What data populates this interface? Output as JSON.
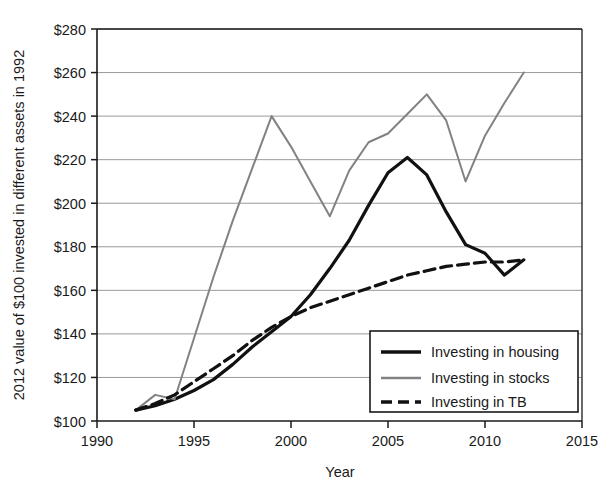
{
  "chart_data": {
    "type": "line",
    "title": "",
    "xlabel": "Year",
    "ylabel": "2012 value of $100 invested in different assets in 1992",
    "xlim": [
      1990,
      2015
    ],
    "ylim": [
      100,
      280
    ],
    "xticks": [
      1990,
      1995,
      2000,
      2005,
      2010,
      2015
    ],
    "xtick_labels": [
      "1990",
      "1995",
      "2000",
      "2005",
      "2010",
      "2015"
    ],
    "yticks": [
      100,
      120,
      140,
      160,
      180,
      200,
      220,
      240,
      260,
      280
    ],
    "ytick_labels": [
      "$100",
      "$120",
      "$140",
      "$160",
      "$180",
      "$200",
      "$220",
      "$240",
      "$260",
      "$280"
    ],
    "grid": true,
    "grid_axis": "y",
    "legend_position": "lower right",
    "x": [
      1992,
      1993,
      1994,
      1995,
      1996,
      1997,
      1998,
      1999,
      2000,
      2001,
      2002,
      2003,
      2004,
      2005,
      2006,
      2007,
      2008,
      2009,
      2010,
      2011,
      2012
    ],
    "series": [
      {
        "name": "Investing in housing",
        "style": "solid",
        "color": "#111111",
        "width": 3.2,
        "values": [
          105,
          107,
          110,
          114,
          119,
          126,
          134,
          141,
          148,
          158,
          170,
          183,
          199,
          214,
          221,
          213,
          196,
          181,
          177,
          167,
          174
        ]
      },
      {
        "name": "Investing in stocks",
        "style": "solid",
        "color": "#828282",
        "width": 2.0,
        "values": [
          105,
          112,
          110,
          138,
          166,
          192,
          216,
          240,
          226,
          210,
          194,
          215,
          228,
          232,
          241,
          250,
          238,
          210,
          231,
          246,
          260
        ]
      },
      {
        "name": "Investing in TB",
        "style": "dashed",
        "color": "#111111",
        "width": 3.2,
        "values": [
          105,
          108,
          112,
          118,
          124,
          130,
          137,
          143,
          148,
          152,
          155,
          158,
          161,
          164,
          167,
          169,
          171,
          172,
          173,
          173,
          174
        ]
      }
    ]
  },
  "legend": {
    "items": [
      {
        "label": "Investing in housing"
      },
      {
        "label": "Investing in stocks"
      },
      {
        "label": "Investing in TB"
      }
    ]
  }
}
